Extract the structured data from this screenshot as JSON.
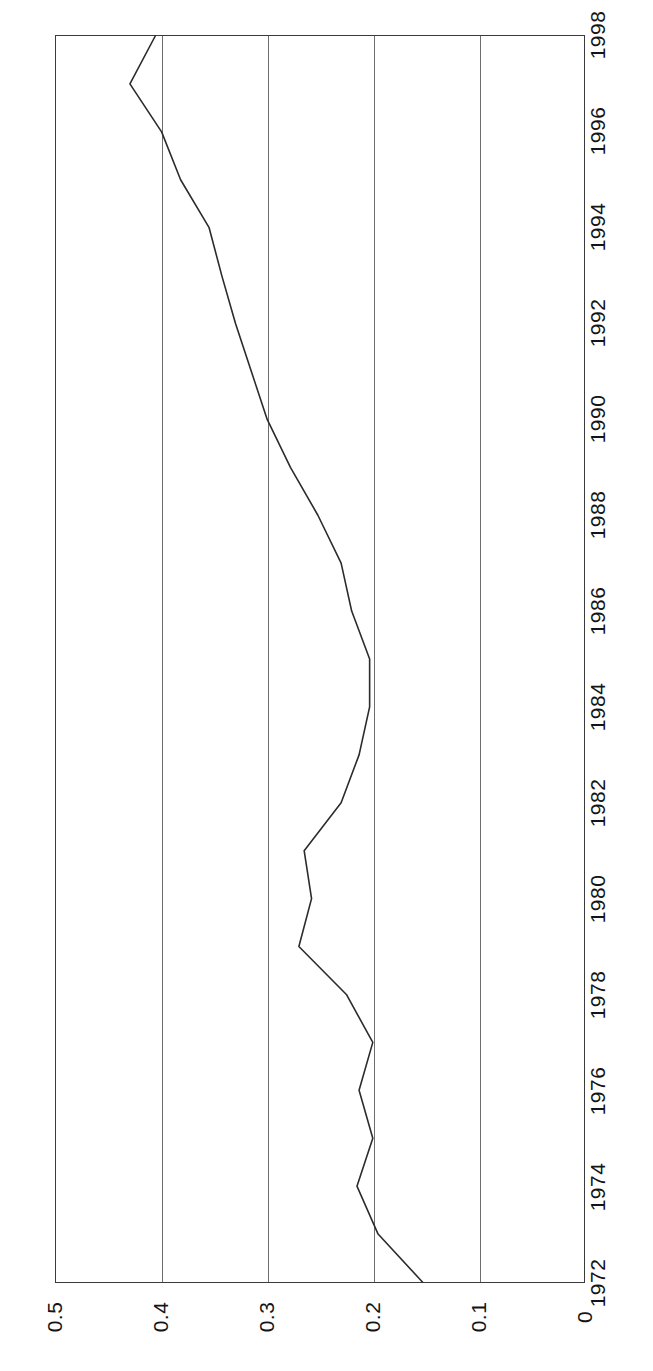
{
  "chart_data": {
    "type": "line",
    "title": "",
    "subtitle": "",
    "orientation": "rotated-90",
    "xlabel": "",
    "ylabel": "",
    "x": [
      1972,
      1973,
      1974,
      1975,
      1976,
      1977,
      1978,
      1979,
      1980,
      1981,
      1982,
      1983,
      1984,
      1985,
      1986,
      1987,
      1988,
      1989,
      1990,
      1991,
      1992,
      1993,
      1994,
      1995,
      1996,
      1997,
      1998
    ],
    "values": [
      0.153,
      0.195,
      0.215,
      0.2,
      0.213,
      0.2,
      0.225,
      0.27,
      0.258,
      0.265,
      0.23,
      0.213,
      0.203,
      0.203,
      0.22,
      0.23,
      0.252,
      0.278,
      0.3,
      0.315,
      0.33,
      0.343,
      0.355,
      0.382,
      0.4,
      0.43,
      0.406
    ],
    "series": [
      {
        "name": "series-1",
        "values": [
          0.153,
          0.195,
          0.215,
          0.2,
          0.213,
          0.2,
          0.225,
          0.27,
          0.258,
          0.265,
          0.23,
          0.213,
          0.203,
          0.203,
          0.22,
          0.23,
          0.252,
          0.278,
          0.3,
          0.315,
          0.33,
          0.343,
          0.355,
          0.382,
          0.4,
          0.43,
          0.406
        ],
        "color": "#2b2b2b"
      }
    ],
    "value_axis": {
      "min": 0,
      "max": 0.5,
      "tick_labels": [
        "0.5",
        "0.4",
        "0.3",
        "0.2",
        "0.1",
        "0"
      ],
      "tick_values": [
        0.5,
        0.4,
        0.3,
        0.2,
        0.1,
        0
      ],
      "direction": "decreasing-left-to-right"
    },
    "category_axis": {
      "min": 1972,
      "max": 1998,
      "tick_labels": [
        "1972",
        "1974",
        "1976",
        "1978",
        "1980",
        "1982",
        "1984",
        "1986",
        "1988",
        "1990",
        "1992",
        "1994",
        "1996",
        "1998"
      ],
      "tick_values": [
        1972,
        1974,
        1976,
        1978,
        1980,
        1982,
        1984,
        1986,
        1988,
        1990,
        1992,
        1994,
        1996,
        1998
      ],
      "direction": "increasing-bottom-to-top"
    },
    "grid": {
      "vertical": true,
      "horizontal": false,
      "color": "#6d6d6d"
    },
    "legend": {
      "visible": false,
      "position": "none",
      "entries": []
    },
    "annotations": [],
    "frame_color": "#3b3b3b",
    "background": "#ffffff"
  }
}
